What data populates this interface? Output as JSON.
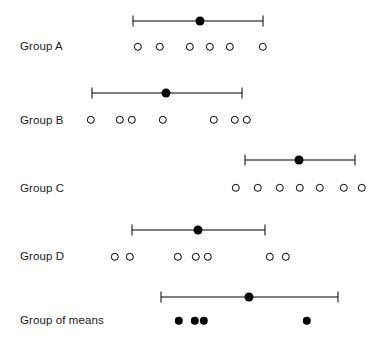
{
  "chart_data": {
    "type": "scatter",
    "title": "",
    "subtitle": "",
    "xlabel": "",
    "ylabel": "",
    "xlim": [
      0,
      381
    ],
    "grid": false,
    "legend": null,
    "categories": [
      "Group A",
      "Group B",
      "Group C",
      "Group D",
      "Group of means"
    ],
    "rows": [
      {
        "label": "Group A",
        "label_y": 46,
        "interval_y": 21,
        "points_y": 47,
        "point_style": "open",
        "mean": 200,
        "ci_low": 133,
        "ci_high": 263,
        "points": [
          138,
          160,
          190,
          210,
          230,
          263
        ]
      },
      {
        "label": "Group B",
        "label_y": 120,
        "interval_y": 93,
        "points_y": 120,
        "point_style": "open",
        "mean": 166,
        "ci_low": 92,
        "ci_high": 242,
        "points": [
          91,
          120,
          132,
          163,
          214,
          235,
          247
        ]
      },
      {
        "label": "Group C",
        "label_y": 188,
        "interval_y": 160,
        "points_y": 188,
        "point_style": "open",
        "mean": 299,
        "ci_low": 245,
        "ci_high": 355,
        "points": [
          236,
          258,
          280,
          300,
          320,
          344,
          362
        ]
      },
      {
        "label": "Group D",
        "label_y": 256,
        "interval_y": 230,
        "points_y": 257,
        "point_style": "open",
        "mean": 198,
        "ci_low": 132,
        "ci_high": 265,
        "points": [
          115,
          130,
          178,
          196,
          208,
          270,
          286
        ]
      },
      {
        "label": "Group of means",
        "label_y": 320,
        "interval_y": 297,
        "points_y": 321,
        "point_style": "filled",
        "mean": 249,
        "ci_low": 161,
        "ci_high": 338,
        "points": [
          179,
          195,
          204,
          307
        ]
      }
    ],
    "style": {
      "background": "#ffffff",
      "line_color": "#000000",
      "marker_open_color": "#000000",
      "marker_filled_color": "#000000",
      "text_color": "#1a1a1a",
      "mean_dot_radius": 4.5,
      "open_marker_radius": 4.2,
      "filled_marker_radius": 4.2,
      "cap_height": 11
    }
  }
}
